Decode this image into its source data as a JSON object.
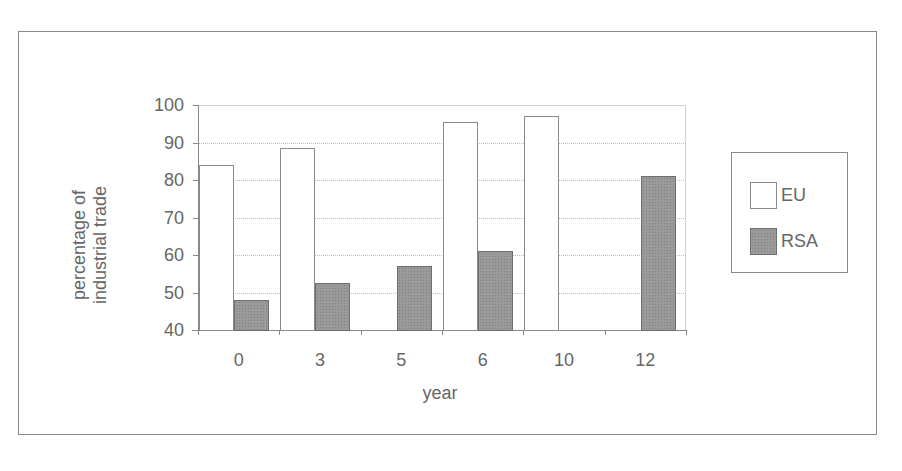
{
  "chart_data": {
    "type": "bar",
    "title": "",
    "xlabel": "year",
    "ylabel": "percentage of industrial trade",
    "ylabel_lines": [
      "percentage of",
      "industrial trade"
    ],
    "categories": [
      "0",
      "3",
      "5",
      "6",
      "10",
      "12"
    ],
    "series": [
      {
        "name": "EU",
        "color": "#ffffff",
        "values": [
          84,
          88.5,
          null,
          95.5,
          97,
          null
        ]
      },
      {
        "name": "RSA",
        "color": "#9a9a9a",
        "values": [
          48,
          52.5,
          57,
          61,
          null,
          81
        ]
      }
    ],
    "ylim": [
      40,
      100
    ],
    "yticks": [
      "100",
      "90",
      "80",
      "70",
      "60",
      "50",
      "40"
    ],
    "grid": true,
    "legend_position": "right"
  }
}
